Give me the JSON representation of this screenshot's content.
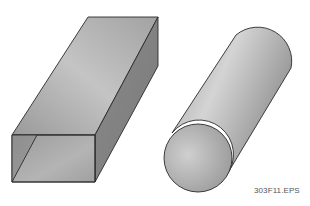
{
  "figure": {
    "caption": "303F11.EPS",
    "shapes": [
      {
        "name": "rectangular-box",
        "description": "Rectangular bar in oblique perspective"
      },
      {
        "name": "cylinder",
        "description": "Round bar / cylinder in oblique perspective"
      }
    ],
    "colors": {
      "outline": "#2a2a2a",
      "fill_light": "#d6d6d6",
      "fill_mid": "#a8a8a8",
      "fill_dark": "#7e7e7e"
    }
  }
}
